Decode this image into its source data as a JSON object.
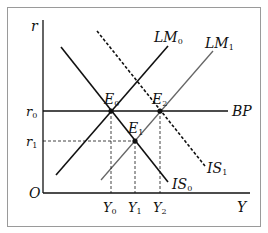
{
  "diagram": {
    "axes": {
      "y_label": "r",
      "x_label": "Y",
      "origin_label": "O"
    },
    "y_ticks": [
      {
        "base": "r",
        "sub": "0"
      },
      {
        "base": "r",
        "sub": "1"
      }
    ],
    "x_ticks": [
      {
        "base": "Y",
        "sub": "0"
      },
      {
        "base": "Y",
        "sub": "1"
      },
      {
        "base": "Y",
        "sub": "2"
      }
    ],
    "curves": [
      {
        "name": "LM",
        "sub": "0",
        "style": "solid"
      },
      {
        "name": "LM",
        "sub": "1",
        "style": "solid-gray"
      },
      {
        "name": "BP",
        "sub": "",
        "style": "solid"
      },
      {
        "name": "IS",
        "sub": "0",
        "style": "solid"
      },
      {
        "name": "IS",
        "sub": "1",
        "style": "dashed"
      }
    ],
    "points": [
      {
        "base": "E",
        "sub": "0"
      },
      {
        "base": "E",
        "sub": "1"
      },
      {
        "base": "E",
        "sub": "2"
      }
    ],
    "colors": {
      "line": "#111111",
      "lm1": "#666666",
      "border": "#999999"
    }
  }
}
